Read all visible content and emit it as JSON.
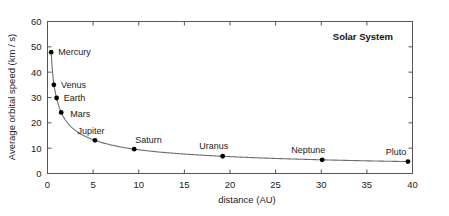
{
  "chart_data": {
    "type": "scatter",
    "title": "Solar System",
    "xlabel": "distance (AU)",
    "ylabel": "Average orbital speed (km / s)",
    "xlim": [
      0,
      40
    ],
    "ylim": [
      0,
      60
    ],
    "xticks": [
      0,
      5,
      10,
      15,
      20,
      25,
      30,
      35,
      40
    ],
    "xtick_labels": [
      "0",
      "5",
      "10",
      "15",
      "20",
      "25",
      "30",
      "35",
      "40"
    ],
    "yticks": [
      0,
      10,
      20,
      30,
      40,
      50,
      60
    ],
    "ytick_labels": [
      "0",
      "10",
      "20",
      "30",
      "40",
      "50",
      "60"
    ],
    "grid": false,
    "legend": false,
    "series_name": "planets",
    "points": [
      {
        "label": "Mercury",
        "x": 0.4,
        "y": 47.9
      },
      {
        "label": "Venus",
        "x": 0.7,
        "y": 35.0
      },
      {
        "label": "Earth",
        "x": 1.0,
        "y": 29.8
      },
      {
        "label": "Mars",
        "x": 1.5,
        "y": 24.1
      },
      {
        "label": "Jupiter",
        "x": 5.2,
        "y": 13.1
      },
      {
        "label": "Saturn",
        "x": 9.5,
        "y": 9.6
      },
      {
        "label": "Uranus",
        "x": 19.2,
        "y": 6.8
      },
      {
        "label": "Neptune",
        "x": 30.1,
        "y": 5.4
      },
      {
        "label": "Pluto",
        "x": 39.5,
        "y": 4.7
      }
    ],
    "point_label_offsets": [
      {
        "label": "Mercury",
        "dx": 7,
        "dy": 3
      },
      {
        "label": "Venus",
        "dx": 7,
        "dy": 3
      },
      {
        "label": "Earth",
        "dx": 7,
        "dy": 3
      },
      {
        "label": "Mars",
        "dx": 9,
        "dy": 5
      },
      {
        "label": "Jupiter",
        "dx": -4,
        "dy": -6
      },
      {
        "label": "Saturn",
        "dx": 1,
        "dy": -6
      },
      {
        "label": "Uranus",
        "dx": -9,
        "dy": -7
      },
      {
        "label": "Neptune",
        "dx": -14,
        "dy": -7
      },
      {
        "label": "Pluto",
        "dx": -12,
        "dy": -7
      }
    ],
    "colors": {
      "curve": "#6e6e6e",
      "point": "#000000",
      "frame": "#555555",
      "text": "#1a1a1a",
      "background": "#ffffff"
    }
  }
}
